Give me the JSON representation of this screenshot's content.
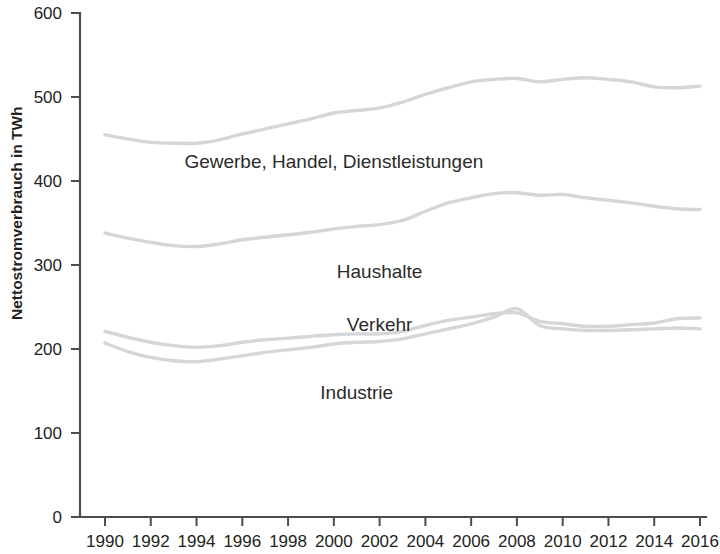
{
  "chart_data": {
    "type": "line",
    "title": "",
    "xlabel": "",
    "ylabel": "Nettostromverbrauch in TWh",
    "xlim": [
      1990,
      2016
    ],
    "ylim": [
      0,
      600
    ],
    "grid": false,
    "legend": "inline-labels",
    "x": [
      1990,
      1991,
      1992,
      1993,
      1994,
      1995,
      1996,
      1997,
      1998,
      1999,
      2000,
      2001,
      2002,
      2003,
      2004,
      2005,
      2006,
      2007,
      2008,
      2009,
      2010,
      2011,
      2012,
      2013,
      2014,
      2015,
      2016
    ],
    "xticks": [
      "1990",
      "1992",
      "1994",
      "1996",
      "1998",
      "2000",
      "2002",
      "2004",
      "2006",
      "2008",
      "2010",
      "2012",
      "2014",
      "2016"
    ],
    "yticks": [
      "0",
      "100",
      "200",
      "300",
      "400",
      "500",
      "600"
    ],
    "series": [
      {
        "name": "Gewerbe, Handel, Dienstleistungen",
        "label_x": 2000,
        "label_y": 415,
        "color": "#d4d6d8",
        "values": [
          455,
          450,
          446,
          445,
          445,
          449,
          456,
          462,
          468,
          474,
          481,
          484,
          487,
          494,
          503,
          511,
          518,
          521,
          522,
          518,
          521,
          523,
          521,
          518,
          512,
          511,
          513
        ]
      },
      {
        "name": "Haushalte",
        "label_x": 2002,
        "label_y": 285,
        "color": "#d4d6d8",
        "values": [
          338,
          332,
          327,
          323,
          322,
          325,
          330,
          333,
          336,
          339,
          343,
          346,
          348,
          353,
          364,
          374,
          380,
          385,
          386,
          383,
          384,
          380,
          377,
          374,
          370,
          367,
          366
        ]
      },
      {
        "name": "Verkehr",
        "label_x": 2002,
        "label_y": 222,
        "color": "#d4d6d8",
        "values": [
          221,
          214,
          208,
          204,
          202,
          204,
          208,
          211,
          213,
          215,
          217,
          218,
          218,
          221,
          228,
          234,
          238,
          242,
          243,
          233,
          230,
          227,
          227,
          229,
          231,
          236,
          237
        ]
      },
      {
        "name": "Industrie",
        "label_x": 2001,
        "label_y": 140,
        "color": "#d4d6d8",
        "values": [
          207,
          197,
          190,
          186,
          185,
          188,
          192,
          196,
          199,
          202,
          206,
          208,
          209,
          212,
          218,
          224,
          230,
          238,
          248,
          228,
          224,
          222,
          222,
          223,
          224,
          225,
          224
        ]
      }
    ]
  }
}
